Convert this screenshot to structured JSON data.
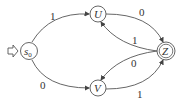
{
  "diagram": {
    "type": "finite-automaton",
    "start_arrow": "start-arrow-icon",
    "states": [
      {
        "id": "s0",
        "label": "s",
        "sub": "0",
        "initial": true,
        "accepting": false
      },
      {
        "id": "U",
        "label": "U",
        "initial": false,
        "accepting": false
      },
      {
        "id": "V",
        "label": "V",
        "initial": false,
        "accepting": false
      },
      {
        "id": "Z",
        "label": "Z",
        "initial": false,
        "accepting": true
      }
    ],
    "transitions": [
      {
        "from": "s0",
        "to": "U",
        "label": "1"
      },
      {
        "from": "s0",
        "to": "V",
        "label": "0"
      },
      {
        "from": "U",
        "to": "Z",
        "label": "0"
      },
      {
        "from": "Z",
        "to": "U",
        "label": "1"
      },
      {
        "from": "Z",
        "to": "V",
        "label": "0"
      },
      {
        "from": "V",
        "to": "Z",
        "label": "1"
      }
    ]
  }
}
